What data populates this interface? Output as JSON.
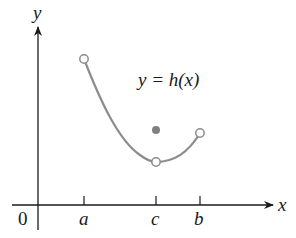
{
  "diagram": {
    "type": "function-graph",
    "function_label": "y = h(x)",
    "axes": {
      "x_label": "x",
      "y_label": "y",
      "origin_label": "0"
    },
    "x_ticks": [
      {
        "label": "a"
      },
      {
        "label": "c"
      },
      {
        "label": "b"
      }
    ],
    "points": [
      {
        "name": "left-endpoint",
        "x": "a",
        "style": "open"
      },
      {
        "name": "hole-at-c",
        "x": "c",
        "style": "open"
      },
      {
        "name": "value-at-c",
        "x": "c",
        "style": "filled"
      },
      {
        "name": "right-endpoint",
        "x": "b",
        "style": "open"
      }
    ],
    "colors": {
      "axis": "#1a1a1a",
      "curve": "#8c8c8c",
      "filled_point": "#808080",
      "text": "#1a1a1a"
    }
  }
}
